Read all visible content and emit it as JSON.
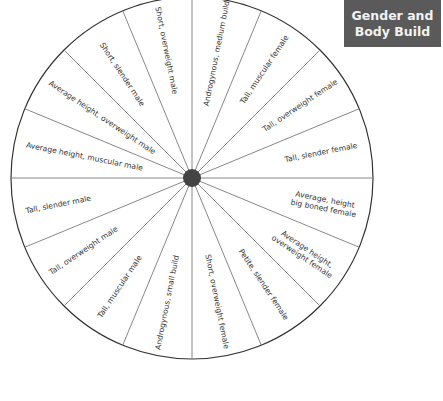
{
  "title": {
    "line1": "Gender and",
    "line2": "Body Build",
    "background": "#5a5a5a",
    "text_color": "#f2f2f2"
  },
  "wheel": {
    "center": [
      192,
      178
    ],
    "radius": 181,
    "hub_radius": 9,
    "hub_color": "#444444",
    "line_color": "#888888",
    "rim_color": "#333333",
    "segment_count": 16,
    "segments": [
      {
        "label": "Androgynous, medium build",
        "angle": 11.25,
        "r": 127,
        "rot": -78.75
      },
      {
        "label": "Tall, muscular female",
        "angle": 33.75,
        "r": 130,
        "rot": -56.25
      },
      {
        "label": "Tall, overweight female",
        "angle": 56.25,
        "r": 130,
        "rot": -33.75
      },
      {
        "label": "Tall, slender female",
        "angle": 78.75,
        "r": 132,
        "rot": -11.25
      },
      {
        "label": "Average, height\nbig boned female",
        "angle": 101.25,
        "r": 135,
        "rot": 11.25
      },
      {
        "label": "Average height,\noverweight female",
        "angle": 123.75,
        "r": 135,
        "rot": 33.75
      },
      {
        "label": "Petite, slender female",
        "angle": 146.25,
        "r": 128,
        "rot": 56.25
      },
      {
        "label": "Short, overweight female",
        "angle": 168.75,
        "r": 126,
        "rot": 78.75
      },
      {
        "label": "Androgynous, small build",
        "angle": 191.25,
        "r": 127,
        "rot": -78.75
      },
      {
        "label": "Tall, muscular male",
        "angle": 213.75,
        "r": 130,
        "rot": -56.25
      },
      {
        "label": "Tall, overweight male",
        "angle": 236.25,
        "r": 130,
        "rot": -33.75
      },
      {
        "label": "Tall, slender male",
        "angle": 258.75,
        "r": 136,
        "rot": -11.25
      },
      {
        "label": "Average height, muscular male",
        "angle": 281.25,
        "r": 110,
        "rot": 11.25
      },
      {
        "label": "Average height, overweight male",
        "angle": 303.75,
        "r": 108,
        "rot": 33.75
      },
      {
        "label": "Short, slender male",
        "angle": 326.25,
        "r": 125,
        "rot": 56.25
      },
      {
        "label": "Short, overweight male",
        "angle": 348.75,
        "r": 130,
        "rot": 78.75
      }
    ]
  }
}
